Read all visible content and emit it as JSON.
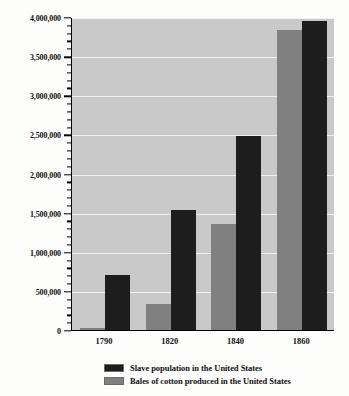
{
  "chart_data": {
    "type": "bar",
    "title": "",
    "subtitle": "",
    "xlabel": "",
    "ylabel": "",
    "categories": [
      "1790",
      "1820",
      "1840",
      "1860"
    ],
    "series": [
      {
        "name": "Slave population in the United States",
        "color": "#1d1d1d",
        "values": [
          700000,
          1540000,
          2480000,
          3950000
        ]
      },
      {
        "name": "Bales of cotton produced in the United States",
        "color": "#808080",
        "values": [
          25000,
          335000,
          1350000,
          3840000
        ]
      }
    ],
    "ylim": [
      0,
      4000000
    ],
    "y_major_step": 500000,
    "y_minor_step": 100000,
    "y_tick_labels": [
      "0",
      "500,000",
      "1,000,000",
      "1,500,000",
      "2,000,000",
      "2,500,000",
      "3,000,000",
      "3,500,000",
      "4,000,000"
    ],
    "grid": true,
    "grid_color": "#f2f2f0",
    "plot_background": "#c9c9c9",
    "legend_position": "bottom"
  },
  "legend": {
    "items": [
      {
        "label": "Slave population in the United States",
        "color": "#1d1d1d"
      },
      {
        "label": "Bales of cotton produced in the United States",
        "color": "#808080"
      }
    ]
  }
}
